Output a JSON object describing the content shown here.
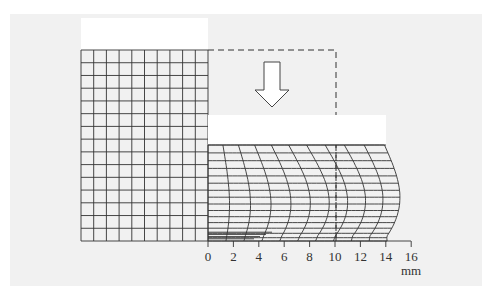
{
  "diagram": {
    "axis": {
      "unit_label": "mm",
      "ticks": [
        "0",
        "2",
        "4",
        "6",
        "8",
        "10",
        "12",
        "14",
        "16"
      ]
    },
    "elements": {
      "initial_grid": "undeformed square mesh (10 columns x 15 rows)",
      "initial_outline": "dashed outline of original billet half",
      "arrow": "downward compression arrow",
      "die_top": "upper die (white block)",
      "deformed_grid": "barrelled deformed mesh"
    },
    "colors": {
      "background_panel": "#f1f1f1",
      "line": "#333333",
      "die": "#ffffff"
    }
  }
}
